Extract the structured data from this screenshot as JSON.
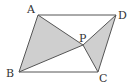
{
  "diagram": {
    "type": "parallelogram",
    "colors": {
      "stroke": "#555555",
      "fill": "#cfcfcf",
      "label": "#333333",
      "background": "#ffffff"
    },
    "points": {
      "A": {
        "label": "A",
        "x": 38,
        "y": 15
      },
      "B": {
        "label": "B",
        "x": 19,
        "y": 72
      },
      "C": {
        "label": "C",
        "x": 98,
        "y": 72
      },
      "D": {
        "label": "D",
        "x": 116,
        "y": 15
      },
      "P": {
        "label": "P",
        "x": 83,
        "y": 45
      }
    },
    "shaded_triangles": [
      "ABP",
      "PCD"
    ],
    "segments": [
      "AB",
      "BC",
      "CD",
      "DA",
      "AP",
      "BP",
      "CP",
      "DP"
    ]
  }
}
